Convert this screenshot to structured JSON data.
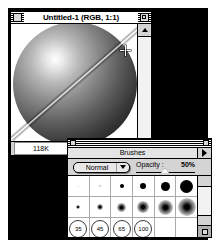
{
  "document_window": {
    "title": "Untitled-1  (RGB, 1:1)",
    "close_box_name": "close-box",
    "zoom_box_name": "zoom-box",
    "status_size": "118K",
    "canvas_alt": "grayscale sphere with specular highlight and diagonal light streak"
  },
  "brushes_palette": {
    "tab_label": "Brushes",
    "menu_icon": "palette-menu-triangle-icon",
    "mode": {
      "selected": "Normal",
      "options": [
        "Normal",
        "Darken",
        "Lighten",
        "Hue",
        "Saturation",
        "Color",
        "Luminosity"
      ]
    },
    "opacity": {
      "label": "Opacity :",
      "value": "50%",
      "percent": 50
    },
    "brush_rows": [
      {
        "name": "hard-round-row",
        "cells": [
          {
            "size": 1,
            "kind": "faint"
          },
          {
            "size": 2,
            "kind": "faint"
          },
          {
            "size": 4,
            "kind": "hard"
          },
          {
            "size": 6,
            "kind": "hard"
          },
          {
            "size": 9,
            "kind": "hard"
          },
          {
            "size": 13,
            "kind": "hard"
          }
        ]
      },
      {
        "name": "soft-round-row",
        "cells": [
          {
            "size": 4,
            "kind": "soft"
          },
          {
            "size": 6,
            "kind": "soft"
          },
          {
            "size": 9,
            "kind": "soft"
          },
          {
            "size": 12,
            "kind": "soft"
          },
          {
            "size": 15,
            "kind": "soft"
          },
          {
            "size": 18,
            "kind": "soft"
          }
        ]
      },
      {
        "name": "large-brush-row",
        "cells": [
          {
            "label": "35",
            "kind": "ring"
          },
          {
            "label": "45",
            "kind": "ring"
          },
          {
            "label": "65",
            "kind": "ring"
          },
          {
            "label": "100",
            "kind": "ring"
          },
          {
            "label": "",
            "kind": "empty"
          },
          {
            "label": "",
            "kind": "empty"
          }
        ]
      }
    ],
    "scroll_up_icon": "scroll-up-arrow-icon",
    "scroll_down_icon": "scroll-down-arrow-icon",
    "grow_icon": "resize-grip-icon"
  },
  "colors": {
    "window_chrome": "#d4d4d4",
    "backdrop": "#000000",
    "canvas": "#ffffff",
    "outline": "#000000"
  }
}
